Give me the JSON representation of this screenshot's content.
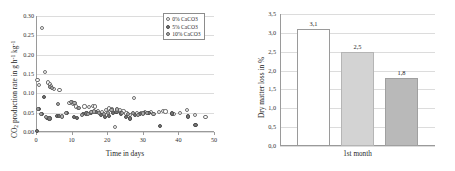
{
  "figure": {
    "panels": [
      "co2-production-scatter",
      "dry-matter-loss-bar"
    ]
  },
  "chart_data": [
    {
      "id": "left",
      "type": "scatter",
      "title": "",
      "xlabel": "Time in days",
      "ylabel": "CO2 production rate in g h-1 kg-1",
      "ylabel_parts": {
        "lead": "CO",
        "sub1": "2",
        "mid": " production rate in g h",
        "sup1": "-1",
        "tail": " kg",
        "sup2": "-1"
      },
      "xlim": [
        0,
        50
      ],
      "ylim": [
        0.0,
        0.3
      ],
      "xticks": [
        "0",
        "10",
        "20",
        "30",
        "40",
        "50"
      ],
      "xtick_values": [
        0,
        10,
        20,
        30,
        40,
        50
      ],
      "yticks": [
        "0.00",
        "0.05",
        "0.10",
        "0.15",
        "0.20",
        "0.25",
        "0.30"
      ],
      "ytick_values": [
        0.0,
        0.05,
        0.1,
        0.15,
        0.2,
        0.25,
        0.3
      ],
      "grid": true,
      "legend_position": "top-right",
      "series": [
        {
          "name": "0% CaCO3",
          "marker": "open-circle",
          "color": "#ffffff",
          "edge": "#6f6f6f",
          "points": [
            [
              0.4,
              0.135
            ],
            [
              0.8,
              0.122
            ],
            [
              1.6,
              0.27
            ],
            [
              2.6,
              0.156
            ],
            [
              3.4,
              0.128
            ],
            [
              3.9,
              0.123
            ],
            [
              4.2,
              0.119
            ],
            [
              5.0,
              0.112
            ],
            [
              6.6,
              0.108
            ],
            [
              9.4,
              0.074
            ],
            [
              10.1,
              0.078
            ],
            [
              10.4,
              0.072
            ],
            [
              11.2,
              0.066
            ],
            [
              11.8,
              0.063
            ],
            [
              13.6,
              0.066
            ],
            [
              14.8,
              0.064
            ],
            [
              15.9,
              0.068
            ],
            [
              16.6,
              0.066
            ],
            [
              17.4,
              0.053
            ],
            [
              18.6,
              0.052
            ],
            [
              19.6,
              0.056
            ],
            [
              20.6,
              0.061
            ],
            [
              21.4,
              0.058
            ],
            [
              22.2,
              0.012
            ],
            [
              23.6,
              0.057
            ],
            [
              24.6,
              0.053
            ],
            [
              25.4,
              0.048
            ],
            [
              26.4,
              0.043
            ],
            [
              27.6,
              0.088
            ],
            [
              28.4,
              0.048
            ],
            [
              29.4,
              0.05
            ],
            [
              30.6,
              0.051
            ],
            [
              32.4,
              0.052
            ],
            [
              34.6,
              0.051
            ],
            [
              35.6,
              0.055
            ],
            [
              36.4,
              0.053
            ],
            [
              38.6,
              0.047
            ],
            [
              40.4,
              0.049
            ],
            [
              42.4,
              0.056
            ],
            [
              44.6,
              0.045
            ],
            [
              47.6,
              0.038
            ]
          ]
        },
        {
          "name": "5% CaCO3",
          "marker": "filled-circle",
          "color": "#787878",
          "edge": "#4a4a4a",
          "points": [
            [
              0.2,
              0.002
            ],
            [
              0.9,
              0.06
            ],
            [
              1.6,
              0.047
            ],
            [
              2.2,
              0.09
            ],
            [
              3.1,
              0.036
            ],
            [
              3.8,
              0.035
            ],
            [
              5.8,
              0.042
            ],
            [
              6.4,
              0.041
            ],
            [
              8.8,
              0.05
            ],
            [
              10.6,
              0.038
            ],
            [
              11.6,
              0.036
            ],
            [
              13.2,
              0.046
            ],
            [
              14.2,
              0.048
            ],
            [
              15.4,
              0.05
            ],
            [
              16.8,
              0.051
            ],
            [
              18.2,
              0.044
            ],
            [
              19.4,
              0.038
            ],
            [
              20.4,
              0.042
            ],
            [
              21.6,
              0.05
            ],
            [
              22.6,
              0.052
            ],
            [
              23.8,
              0.048
            ],
            [
              25.2,
              0.038
            ],
            [
              26.4,
              0.035
            ],
            [
              27.8,
              0.043
            ],
            [
              29.2,
              0.046
            ],
            [
              30.4,
              0.049
            ],
            [
              31.6,
              0.05
            ],
            [
              34.8,
              0.015
            ],
            [
              38.2,
              0.048
            ],
            [
              42.6,
              0.04
            ],
            [
              44.8,
              0.018
            ]
          ]
        },
        {
          "name": "10% CaCO3",
          "marker": "gray-circle",
          "color": "#b3b3b3",
          "edge": "#5c5c5c",
          "points": [
            [
              0.6,
              0.06
            ],
            [
              1.4,
              0.046
            ],
            [
              2.8,
              0.038
            ],
            [
              4.0,
              0.117
            ],
            [
              4.6,
              0.114
            ],
            [
              6.2,
              0.073
            ],
            [
              7.2,
              0.04
            ],
            [
              8.4,
              0.049
            ],
            [
              9.8,
              0.077
            ],
            [
              10.8,
              0.075
            ],
            [
              12.0,
              0.062
            ],
            [
              13.0,
              0.044
            ],
            [
              14.6,
              0.046
            ],
            [
              15.6,
              0.052
            ],
            [
              16.4,
              0.053
            ],
            [
              17.8,
              0.05
            ],
            [
              19.0,
              0.046
            ],
            [
              20.2,
              0.05
            ],
            [
              21.2,
              0.056
            ],
            [
              22.8,
              0.058
            ],
            [
              24.2,
              0.05
            ],
            [
              25.8,
              0.046
            ],
            [
              27.2,
              0.049
            ],
            [
              28.6,
              0.045
            ],
            [
              30.0,
              0.048
            ],
            [
              31.2,
              0.05
            ],
            [
              33.0,
              0.047
            ]
          ]
        }
      ]
    },
    {
      "id": "right",
      "type": "bar",
      "title": "",
      "xlabel": "1st month",
      "ylabel": "Dry matter loss in %",
      "categories": [
        "1st month"
      ],
      "bars": [
        {
          "value": 3.1,
          "label": "3,1",
          "fill": "#ffffff",
          "edge": "#9a9a9a"
        },
        {
          "value": 2.5,
          "label": "2,5",
          "fill": "#d3d3d3",
          "edge": "#b5b5b5"
        },
        {
          "value": 1.8,
          "label": "1,8",
          "fill": "#b9b9b9",
          "edge": "#a0a0a0"
        }
      ],
      "ylim": [
        0.0,
        3.5
      ],
      "yticks": [
        "0,0",
        "0,5",
        "1,0",
        "1,5",
        "2,0",
        "2,5",
        "3,0",
        "3,5"
      ],
      "ytick_values": [
        0.0,
        0.5,
        1.0,
        1.5,
        2.0,
        2.5,
        3.0,
        3.5
      ],
      "grid": true,
      "legend_position": "none"
    }
  ],
  "colors": {
    "grid": "#dcdcdc",
    "axis": "#9a9a9a",
    "text": "#2b2b2b"
  }
}
